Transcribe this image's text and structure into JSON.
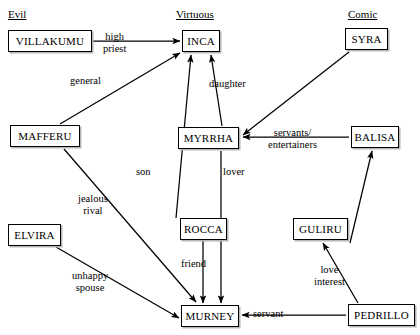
{
  "diagram": {
    "columns": [
      {
        "id": "evil",
        "label": "Evil",
        "x": 8,
        "y": 8
      },
      {
        "id": "virtuous",
        "label": "Virtuous",
        "x": 176,
        "y": 8
      },
      {
        "id": "comic",
        "label": "Comic",
        "x": 348,
        "y": 8
      }
    ],
    "nodes": [
      {
        "id": "villakumu",
        "label": "VILLAKUMU",
        "group": "evil",
        "x": 8,
        "y": 30,
        "w": 84,
        "h": 22
      },
      {
        "id": "mafferu",
        "label": "MAFFERU",
        "group": "evil",
        "x": 10,
        "y": 125,
        "w": 70,
        "h": 22
      },
      {
        "id": "elvira",
        "label": "ELVIRA",
        "group": "evil",
        "x": 8,
        "y": 224,
        "w": 53,
        "h": 22
      },
      {
        "id": "inca",
        "label": "INCA",
        "group": "virtuous",
        "x": 182,
        "y": 30,
        "w": 38,
        "h": 22
      },
      {
        "id": "myrrha",
        "label": "MYRRHA",
        "group": "virtuous",
        "x": 178,
        "y": 127,
        "w": 61,
        "h": 22
      },
      {
        "id": "rocca",
        "label": "ROCCA",
        "group": "virtuous",
        "x": 180,
        "y": 218,
        "w": 47,
        "h": 22
      },
      {
        "id": "murney",
        "label": "MURNEY",
        "group": "virtuous",
        "x": 181,
        "y": 305,
        "w": 58,
        "h": 22
      },
      {
        "id": "syra",
        "label": "SYRA",
        "group": "comic",
        "x": 345,
        "y": 28,
        "w": 43,
        "h": 22
      },
      {
        "id": "balisa",
        "label": "BALISA",
        "group": "comic",
        "x": 351,
        "y": 126,
        "w": 48,
        "h": 22
      },
      {
        "id": "guliru",
        "label": "GULIRU",
        "group": "comic",
        "x": 293,
        "y": 218,
        "w": 55,
        "h": 22
      },
      {
        "id": "pedrillo",
        "label": "PEDRILLO",
        "group": "comic",
        "x": 348,
        "y": 304,
        "w": 67,
        "h": 22
      }
    ],
    "edges": [
      {
        "id": "villakumu-inca",
        "from": "villakumu",
        "to": "inca",
        "label": "high\npriest",
        "lx": 103,
        "ly": 31
      },
      {
        "id": "mafferu-inca",
        "from": "mafferu",
        "to": "inca",
        "label": "general",
        "lx": 70,
        "ly": 75
      },
      {
        "id": "myrrha-inca",
        "from": "myrrha",
        "to": "inca",
        "label": "daughter",
        "lx": 209,
        "ly": 78
      },
      {
        "id": "rocca-inca",
        "from": "rocca",
        "to": "inca",
        "label": "son",
        "lx": 136,
        "ly": 166
      },
      {
        "id": "balisa-myrrha",
        "from": "balisa",
        "to": "myrrha",
        "label": "servants/\nentertainers",
        "lx": 268,
        "ly": 127
      },
      {
        "id": "syra-myrrha",
        "from": "syra",
        "to": "myrrha",
        "label": "",
        "lx": 0,
        "ly": 0
      },
      {
        "id": "rocca-murney",
        "from": "rocca",
        "to": "murney",
        "label": "friend",
        "lx": 181,
        "ly": 258
      },
      {
        "id": "myrrha-murney",
        "from": "myrrha",
        "to": "murney",
        "label": "lover",
        "lx": 223,
        "ly": 166
      },
      {
        "id": "mafferu-murney",
        "from": "mafferu",
        "to": "murney",
        "label": "jealous\nrival",
        "lx": 78,
        "ly": 193
      },
      {
        "id": "elvira-murney",
        "from": "elvira",
        "to": "murney",
        "label": "unhappy\nspouse",
        "lx": 72,
        "ly": 270
      },
      {
        "id": "pedrillo-murney",
        "from": "pedrillo",
        "to": "murney",
        "label": "servant",
        "lx": 253,
        "ly": 308
      },
      {
        "id": "pedrillo-guliru",
        "from": "pedrillo",
        "to": "guliru",
        "label": "love\ninterest",
        "lx": 314,
        "ly": 264
      },
      {
        "id": "guliru-balisa",
        "from": "guliru",
        "to": "balisa",
        "label": "",
        "lx": 0,
        "ly": 0
      }
    ]
  }
}
